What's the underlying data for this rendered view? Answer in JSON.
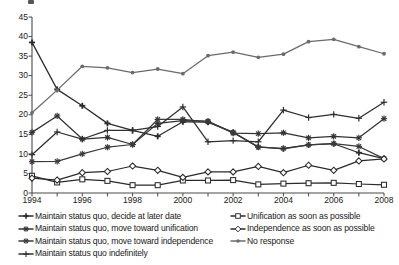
{
  "chart_data": {
    "type": "line",
    "title": "",
    "xlabel": "",
    "ylabel": "",
    "xlim": [
      1994,
      2008
    ],
    "ylim": [
      0,
      45
    ],
    "ytick_step": 5,
    "grid": false,
    "legend_position": "below",
    "x": [
      1994,
      1995,
      1996,
      1997,
      1998,
      1999,
      2000,
      2001,
      2002,
      2003,
      2004,
      2005,
      2006,
      2007,
      2008
    ],
    "xtick_labels": [
      "1994",
      "1996",
      "1998",
      "2000",
      "2002",
      "2004",
      "2006",
      "2008"
    ],
    "ytick_labels": [
      "0",
      "5",
      "10",
      "15",
      "20",
      "25",
      "30",
      "35",
      "40",
      "45"
    ],
    "series": [
      {
        "name": "Maintain status quo, decide at later date",
        "marker": "plus-filled",
        "color": "#2b2b2b",
        "values": [
          38.5,
          26.5,
          22.3,
          17.8,
          16.0,
          14.5,
          18.2,
          18.1,
          15.5,
          11.8,
          11.3,
          12.3,
          12.6,
          10.3,
          8.8
        ]
      },
      {
        "name": "Maintain status quo, move toward unification",
        "marker": "star",
        "color": "#333333",
        "values": [
          15.5,
          19.7,
          13.8,
          14.2,
          12.4,
          17.8,
          18.5,
          18.4,
          15.3,
          15.2,
          15.4,
          14.1,
          14.5,
          14.1,
          19.0
        ]
      },
      {
        "name": "Maintain status quo, move toward independence",
        "marker": "asterisk",
        "color": "#3a3a3a",
        "values": [
          8.0,
          8.1,
          10.0,
          11.7,
          12.4,
          18.8,
          18.8,
          18.2,
          15.5,
          11.7,
          11.4,
          12.3,
          12.6,
          11.9,
          8.8
        ]
      },
      {
        "name": "Maintain status quo indefinitely",
        "marker": "plus-line",
        "color": "#2f2f2f",
        "values": [
          9.8,
          15.6,
          13.8,
          16.0,
          16.0,
          17.0,
          22.0,
          13.1,
          13.4,
          13.1,
          21.2,
          19.3,
          20.1,
          19.1,
          23.2
        ]
      },
      {
        "name": "Unification as soon as possible",
        "marker": "square-open",
        "color": "#2b2b2b",
        "values": [
          4.4,
          2.7,
          3.5,
          3.1,
          2.0,
          2.0,
          3.2,
          3.2,
          3.3,
          2.2,
          2.4,
          2.5,
          2.6,
          2.3,
          2.1
        ]
      },
      {
        "name": "Independence as soon as possible",
        "marker": "diamond-open",
        "color": "#2b2b2b",
        "values": [
          3.8,
          3.3,
          5.2,
          5.5,
          6.9,
          5.8,
          4.0,
          5.4,
          5.4,
          6.8,
          5.2,
          7.1,
          5.8,
          8.2,
          8.7
        ]
      },
      {
        "name": "No response",
        "marker": "circle-filled",
        "color": "#6b6b6b",
        "values": [
          20.5,
          26.3,
          32.4,
          32.0,
          30.8,
          31.7,
          30.5,
          35.1,
          36.0,
          34.7,
          35.5,
          38.7,
          39.3,
          37.4,
          35.6
        ]
      }
    ]
  },
  "legend": {
    "left_column": [
      {
        "label": "Maintain status quo, decide at later date",
        "series_index": 0
      },
      {
        "label": "Maintain status quo, move toward unification",
        "series_index": 1
      },
      {
        "label": "Maintain status quo, move toward independence",
        "series_index": 2
      },
      {
        "label": "Maintain status quo indefinitely",
        "series_index": 3
      }
    ],
    "right_column": [
      {
        "label": "Unification as soon as possible",
        "series_index": 4
      },
      {
        "label": "Independence as soon as possible",
        "series_index": 5
      },
      {
        "label": "No response",
        "series_index": 6
      }
    ]
  }
}
